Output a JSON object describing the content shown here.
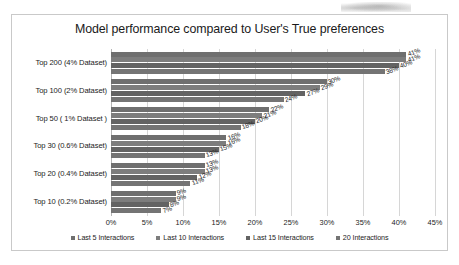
{
  "chart_data": {
    "type": "bar",
    "orientation": "horizontal",
    "title": "Model performance compared to User's True preferences",
    "xlabel": "",
    "ylabel": "",
    "xlim": [
      0,
      45
    ],
    "xtick_labels": [
      "0%",
      "5%",
      "10%",
      "15%",
      "20%",
      "25%",
      "30%",
      "35%",
      "40%",
      "45%"
    ],
    "xtick_values": [
      0,
      5,
      10,
      15,
      20,
      25,
      30,
      35,
      40,
      45
    ],
    "grid": true,
    "legend_position": "bottom",
    "categories": [
      "Top 200 (4% Dataset)",
      "Top 100 (2% Dataset)",
      "Top 50 ( 1% Dataset )",
      "Top 30 (0.6% Dataset)",
      "Top 20 (0.4% Dataset)",
      "Top 10 (0.2% Dataset)"
    ],
    "series": [
      {
        "name": "Last 5 Interactions",
        "color": "#6f6f6f",
        "values": [
          41,
          30,
          22,
          16,
          13,
          9
        ],
        "labels": [
          "41%",
          "30%",
          "22%",
          "16%",
          "13%",
          "9%"
        ]
      },
      {
        "name": "Last 10 Interactions",
        "color": "#7d7d7d",
        "values": [
          41,
          29,
          21,
          16,
          13,
          9
        ],
        "labels": [
          "41%",
          "29%",
          "21%",
          "16%",
          "13%",
          "9%"
        ]
      },
      {
        "name": "Last 15 Interactions",
        "color": "#636363",
        "values": [
          40,
          27,
          20,
          15,
          12,
          8
        ],
        "labels": [
          "40%",
          "27%",
          "20%",
          "15%",
          "12%",
          "8%"
        ]
      },
      {
        "name": "20 Interactions",
        "color": "#747474",
        "values": [
          38,
          24,
          18,
          13,
          11,
          7
        ],
        "labels": [
          "38%",
          "24%",
          "18%",
          "13%",
          "11%",
          "7%"
        ]
      }
    ],
    "extra_labels_by_category": [
      [
        "41%",
        "41%",
        "40%",
        "38%",
        "33%"
      ],
      [
        "30%",
        "29%",
        "27%",
        "24%"
      ],
      [
        "22%",
        "21%",
        "20%",
        "18%"
      ],
      [
        "16%",
        "16%",
        "15%",
        "13%"
      ],
      [
        "13%",
        "13%",
        "12%",
        "11%"
      ],
      [
        "9%",
        "9%",
        "8%",
        "7%"
      ]
    ]
  }
}
